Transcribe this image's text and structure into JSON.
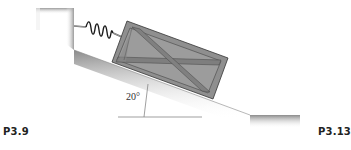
{
  "figure": {
    "angle_label": "20°",
    "left_label": "P3.9",
    "right_label": "P3.13",
    "elements": [
      "wall",
      "spring",
      "crate",
      "incline"
    ],
    "incline_angle_deg": 20
  },
  "colors": {
    "ground_dark": "#9a9a9a",
    "crate_fill": "#8f8f8f",
    "crate_frame": "#6e6e6e",
    "outline": "#333333"
  }
}
